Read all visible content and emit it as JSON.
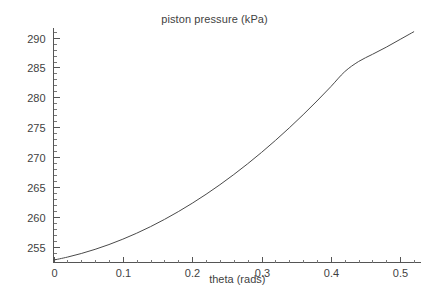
{
  "chart_data": {
    "type": "line",
    "title": "piston pressure (kPa)",
    "xlabel": "theta (rads)",
    "ylabel": "",
    "xlim": [
      0,
      0.53
    ],
    "ylim": [
      252.4,
      291.6
    ],
    "grid": false,
    "legend": null,
    "x_ticks": [
      "0",
      "0.1",
      "0.2",
      "0.3",
      "0.4",
      "0.5"
    ],
    "x_tick_values": [
      0,
      0.1,
      0.2,
      0.3,
      0.4,
      0.5
    ],
    "x_minor_interval": 0.02,
    "y_ticks": [
      "255",
      "260",
      "265",
      "270",
      "275",
      "280",
      "285",
      "290"
    ],
    "y_tick_values": [
      255,
      260,
      265,
      270,
      275,
      280,
      285,
      290
    ],
    "y_minor_interval": 1,
    "series": [
      {
        "name": "piston pressure",
        "color": "#4a4a4a",
        "x": [
          0.0,
          0.02,
          0.04,
          0.06,
          0.08,
          0.1,
          0.12,
          0.14,
          0.16,
          0.18,
          0.2,
          0.22,
          0.24,
          0.26,
          0.28,
          0.3,
          0.32,
          0.34,
          0.36,
          0.38,
          0.4,
          0.42,
          0.44,
          0.46,
          0.48,
          0.5,
          0.52
        ],
        "y": [
          252.8,
          253.3,
          253.9,
          254.6,
          255.4,
          256.3,
          257.3,
          258.4,
          259.6,
          260.9,
          262.3,
          263.8,
          265.4,
          267.1,
          268.9,
          270.8,
          272.8,
          274.9,
          277.1,
          279.4,
          281.8,
          284.3,
          286.0,
          287.2,
          288.4,
          289.7,
          291.0
        ]
      }
    ]
  },
  "figure": {
    "background_color": "#ffffff",
    "axis_color": "#555555",
    "text_color": "#3f3f3f"
  }
}
